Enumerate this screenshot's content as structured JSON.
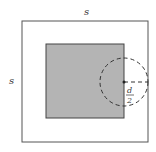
{
  "diagram": {
    "outer_square_label_top": "s",
    "outer_square_label_left": "s",
    "radius_label_numerator": "d",
    "radius_label_denominator": "2",
    "colors": {
      "outer_square_stroke": "#555555",
      "inner_square_fill": "#b4b4b4",
      "inner_square_stroke": "#444444",
      "circle_stroke": "#333333"
    }
  }
}
